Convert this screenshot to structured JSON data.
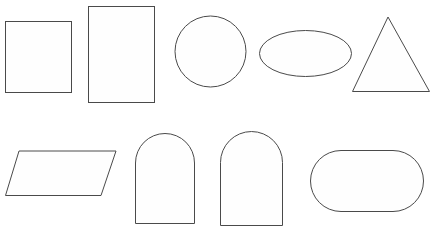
{
  "canvas": {
    "width": 433,
    "height": 234,
    "background_color": "#ffffff",
    "stroke_color": "#4a4a4a",
    "fill_color": "#fefefe",
    "stroke_width": 1,
    "title": "Geometric shape outlines"
  },
  "chart_data": {
    "type": "diagram",
    "layout": "two rows of five shapes, all unfilled outlines on white",
    "rows": 2,
    "columns": 5,
    "shape_count": 10,
    "shapes": [
      {
        "name": "square",
        "row": 1,
        "column": 1,
        "geometry": "rect",
        "x": 5,
        "y": 21,
        "width": 67,
        "height": 72
      },
      {
        "name": "rectangle",
        "row": 1,
        "column": 2,
        "geometry": "rect",
        "x": 88,
        "y": 6,
        "width": 67,
        "height": 97
      },
      {
        "name": "circle",
        "row": 1,
        "column": 3,
        "geometry": "circle",
        "cx": 210.5,
        "cy": 51.5,
        "r": 36
      },
      {
        "name": "ellipse",
        "row": 1,
        "column": 4,
        "geometry": "ellipse",
        "cx": 305.5,
        "cy": 53.5,
        "rx": 46.5,
        "ry": 23.5
      },
      {
        "name": "triangle",
        "row": 1,
        "column": 5,
        "geometry": "polygon",
        "points": "388,17 430,92 352,92"
      },
      {
        "name": "parallelogram",
        "row": 2,
        "column": 1,
        "geometry": "polygon",
        "points": "19,151 116,151 101,196 5,196"
      },
      {
        "name": "arch-narrow",
        "row": 2,
        "column": 2,
        "geometry": "arch",
        "path": "M 135,224 L 135,163 A 29.5 29.5 0 0 1 194,163 L 194,224 Z"
      },
      {
        "name": "arch-wide",
        "row": 2,
        "column": 3,
        "geometry": "arch",
        "path": "M 220,226 L 220,162.5 A 31.5 31.5 0 0 1 283,162.5 L 283,226 Z"
      },
      {
        "name": "stadium",
        "row": 2,
        "column": 4,
        "geometry": "rounded-rect",
        "x": 310,
        "y": 150,
        "width": 114,
        "height": 62,
        "rx": 31
      }
    ]
  }
}
